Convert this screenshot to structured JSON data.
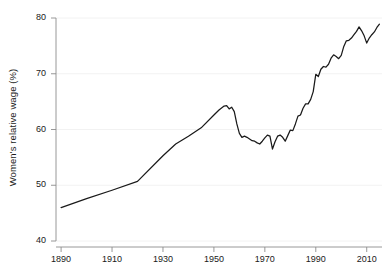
{
  "chart_data": {
    "type": "line",
    "title": "",
    "subtitle": "",
    "xlabel": "",
    "ylabel": "Women's relative wage (%)",
    "xlim": [
      1888,
      2016
    ],
    "ylim": [
      40,
      80
    ],
    "xticks": [
      1890,
      1910,
      1930,
      1950,
      1970,
      1990,
      2010
    ],
    "yticks": [
      40,
      50,
      60,
      70,
      80
    ],
    "xtick_labels": [
      "1890",
      "1910",
      "1930",
      "1950",
      "1970",
      "1990",
      "2010"
    ],
    "ytick_labels": [
      "40",
      "50",
      "60",
      "70",
      "80"
    ],
    "grid": "horizontal-faint",
    "legend": "none",
    "line_color": "#1a1a1a",
    "grid_color": "#f2f2f2",
    "axis_color": "#8c8c8c",
    "series": [
      {
        "name": "Women's relative wage",
        "x": [
          1890,
          1900,
          1910,
          1920,
          1930,
          1935,
          1940,
          1945,
          1950,
          1952,
          1954,
          1955,
          1956,
          1957,
          1958,
          1959,
          1960,
          1961,
          1962,
          1963,
          1964,
          1965,
          1966,
          1967,
          1968,
          1969,
          1970,
          1971,
          1972,
          1973,
          1974,
          1975,
          1976,
          1977,
          1978,
          1979,
          1980,
          1981,
          1982,
          1983,
          1984,
          1985,
          1986,
          1987,
          1988,
          1989,
          1990,
          1991,
          1992,
          1993,
          1994,
          1995,
          1996,
          1997,
          1998,
          1999,
          2000,
          2001,
          2002,
          2003,
          2004,
          2005,
          2006,
          2007,
          2008,
          2009,
          2010,
          2011,
          2012,
          2013,
          2014,
          2015
        ],
        "y": [
          46.0,
          47.6,
          49.1,
          50.7,
          55.3,
          57.4,
          58.8,
          60.3,
          62.6,
          63.5,
          64.2,
          64.3,
          63.7,
          64.0,
          63.2,
          61.0,
          59.3,
          58.6,
          58.8,
          58.6,
          58.3,
          58.0,
          57.9,
          57.6,
          57.4,
          57.9,
          58.5,
          59.0,
          58.8,
          56.5,
          57.8,
          58.8,
          59.0,
          58.6,
          57.9,
          58.9,
          59.9,
          59.8,
          61.0,
          62.4,
          62.6,
          63.8,
          64.6,
          64.6,
          65.4,
          66.8,
          69.9,
          69.5,
          70.8,
          71.3,
          71.2,
          71.7,
          72.8,
          73.4,
          73.1,
          72.7,
          73.3,
          74.9,
          75.9,
          76.0,
          76.4,
          77.0,
          77.6,
          78.4,
          77.7,
          76.8,
          75.5,
          76.4,
          77.0,
          77.5,
          78.3,
          78.9
        ]
      }
    ]
  },
  "axis": {
    "y_label": "Women's relative wage (%)"
  }
}
